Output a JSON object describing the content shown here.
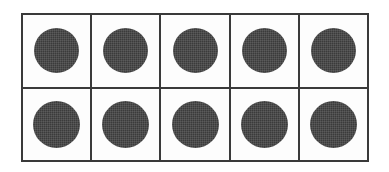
{
  "figure": {
    "kind": "ten-frame",
    "title": "Ten Frame",
    "background_color": "#ffffff",
    "frame_fill_color": "#fdfdfd",
    "line_color": "#3a3a3a",
    "counter_color": "#3b3b3b",
    "columns": 5,
    "rows": 2,
    "total_cells": 10,
    "filled_count": 10,
    "empty_count": 0
  },
  "chart_data": {
    "type": "table",
    "title": "Ten Frame",
    "xlabel": "",
    "ylabel": "",
    "categories": [
      "col-1",
      "col-2",
      "col-3",
      "col-4",
      "col-5"
    ],
    "rows": [
      {
        "name": "top-row",
        "values": [
          1,
          1,
          1,
          1,
          1
        ]
      },
      {
        "name": "bottom-row",
        "values": [
          1,
          1,
          1,
          1,
          1
        ]
      }
    ],
    "legend": [
      {
        "label": "filled counter",
        "color": "#3b3b3b"
      },
      {
        "label": "empty cell",
        "color": "#fdfdfd"
      }
    ],
    "total": 10
  },
  "cells": {
    "top": [
      {
        "id": "r1c1",
        "filled": true,
        "counter_name": "counter-disc"
      },
      {
        "id": "r1c2",
        "filled": true,
        "counter_name": "counter-disc"
      },
      {
        "id": "r1c3",
        "filled": true,
        "counter_name": "counter-disc"
      },
      {
        "id": "r1c4",
        "filled": true,
        "counter_name": "counter-disc"
      },
      {
        "id": "r1c5",
        "filled": true,
        "counter_name": "counter-disc"
      }
    ],
    "bottom": [
      {
        "id": "r2c1",
        "filled": true,
        "counter_name": "counter-disc"
      },
      {
        "id": "r2c2",
        "filled": true,
        "counter_name": "counter-disc"
      },
      {
        "id": "r2c3",
        "filled": true,
        "counter_name": "counter-disc"
      },
      {
        "id": "r2c4",
        "filled": true,
        "counter_name": "counter-disc"
      },
      {
        "id": "r2c5",
        "filled": true,
        "counter_name": "counter-disc"
      }
    ]
  }
}
